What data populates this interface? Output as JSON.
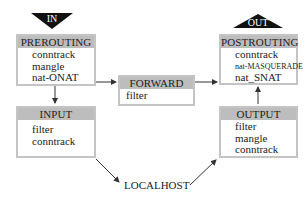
{
  "diagram": {
    "entry": {
      "label": "IN"
    },
    "exit": {
      "label": "OUT"
    },
    "chains": {
      "prerouting": {
        "title": "PREROUTING",
        "items": [
          "conntrack",
          "mangle",
          "nat-ONAT"
        ],
        "flow": "down"
      },
      "input": {
        "title": "INPUT",
        "items": [
          "filter",
          "conntrack"
        ],
        "flow": "down"
      },
      "forward": {
        "title": "FORWARD",
        "items": [
          "filter"
        ]
      },
      "postrouting": {
        "title": "POSTROUTING",
        "items": [
          "conntrack",
          "nat-MASQUERADE",
          "nat_SNAT"
        ],
        "flow": "up"
      },
      "output": {
        "title": "OUTPUT",
        "items": [
          "filter",
          "mangle",
          "conntrack"
        ],
        "flow": "up"
      }
    },
    "localhost": {
      "label": "LOCALHOST"
    },
    "colors": {
      "header": "#bdbdbd",
      "border": "#c4c4c4",
      "triangle": "#111111",
      "line": "#333333"
    }
  }
}
